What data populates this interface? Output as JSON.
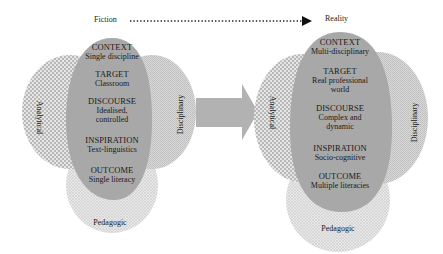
{
  "header": {
    "left_label": "Fiction",
    "right_label": "Reality",
    "arrow_style": "dotted"
  },
  "colors": {
    "core": "#a9a9a9",
    "analytical": "#d0d0d0",
    "disciplinary": "#c8c8c8",
    "pedagogic": "#dcdcdc",
    "transition_arrow": "#b0b0b0"
  },
  "left_diagram": {
    "side_labels": {
      "left": "Analytical",
      "right": "Disciplinary",
      "bottom": "Pedagogic"
    },
    "sections": [
      {
        "heading": "CONTEXT",
        "lines": [
          "Single discipline"
        ]
      },
      {
        "heading": "TARGET",
        "lines": [
          "Classroom"
        ]
      },
      {
        "heading": "DISCOURSE",
        "lines": [
          "Idealised,",
          "controlled"
        ]
      },
      {
        "heading": "INSPIRATION",
        "lines": [
          "Text-linguistics"
        ]
      },
      {
        "heading": "OUTCOME",
        "lines": [
          "Single literacy"
        ]
      }
    ]
  },
  "right_diagram": {
    "side_labels": {
      "left": "Analytical",
      "right": "Disciplinary",
      "bottom": "Pedagogic"
    },
    "sections": [
      {
        "heading": "CONTEXT",
        "lines": [
          "Multi-disciplinary"
        ]
      },
      {
        "heading": "TARGET",
        "lines": [
          "Real professional",
          "world"
        ]
      },
      {
        "heading": "DISCOURSE",
        "lines": [
          "Complex and",
          "dynamic"
        ]
      },
      {
        "heading": "INSPIRATION",
        "lines": [
          "Socio-cognitive"
        ]
      },
      {
        "heading": "OUTCOME",
        "lines": [
          "Multiple literacies"
        ]
      }
    ]
  }
}
